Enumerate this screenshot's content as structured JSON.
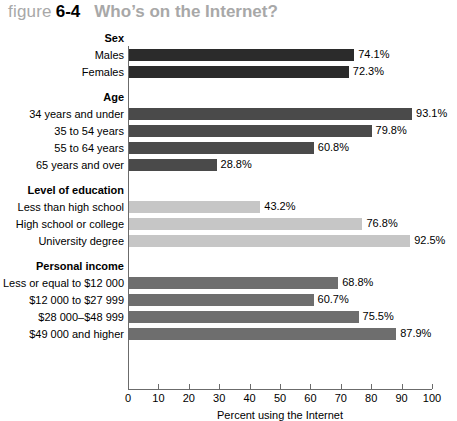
{
  "title": {
    "kicker": "figure",
    "number": "6-4",
    "headline": "Who’s on the Internet?"
  },
  "chart_data": {
    "type": "bar",
    "orientation": "horizontal",
    "title": "Who’s on the Internet?",
    "xlabel": "Percent using the Internet",
    "ylabel": "",
    "xlim": [
      0,
      100
    ],
    "xticks": [
      0,
      10,
      20,
      30,
      40,
      50,
      60,
      70,
      80,
      90,
      100
    ],
    "xtick_labels": [
      "0",
      "10",
      "20",
      "30",
      "40",
      "50",
      "60",
      "70",
      "80",
      "90",
      "100"
    ],
    "grid": false,
    "legend": false,
    "value_label_suffix": "%",
    "groups": [
      {
        "name": "Sex",
        "color": "#2b2b2b",
        "categories": [
          "Males",
          "Females"
        ],
        "values": [
          74.1,
          72.3
        ],
        "value_labels": [
          "74.1%",
          "72.3%"
        ]
      },
      {
        "name": "Age",
        "color": "#4a4a4a",
        "categories": [
          "34 years and under",
          "35 to 54 years",
          "55 to 64 years",
          "65 years and over"
        ],
        "values": [
          93.1,
          79.8,
          60.8,
          28.8
        ],
        "value_labels": [
          "93.1%",
          "79.8%",
          "60.8%",
          "28.8%"
        ]
      },
      {
        "name": "Level of education",
        "color": "#c6c6c6",
        "categories": [
          "Less than high school",
          "High school or college",
          "University degree"
        ],
        "values": [
          43.2,
          76.8,
          92.5
        ],
        "value_labels": [
          "43.2%",
          "76.8%",
          "92.5%"
        ]
      },
      {
        "name": "Personal income",
        "color": "#6e6e6e",
        "categories": [
          "Less or equal to $12 000",
          "$12 000 to $27 999",
          "$28 000–$48 999",
          "$49 000 and higher"
        ],
        "values": [
          68.8,
          60.7,
          75.5,
          87.9
        ],
        "value_labels": [
          "68.8%",
          "60.7%",
          "75.5%",
          "87.9%"
        ]
      }
    ]
  }
}
